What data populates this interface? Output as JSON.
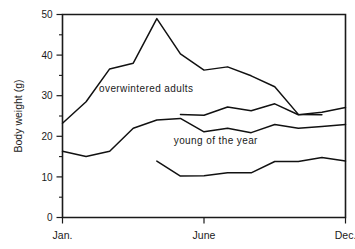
{
  "chart_data": {
    "type": "line",
    "title": "",
    "xlabel": "",
    "ylabel": "Body weight (g)",
    "ylim": [
      0,
      50
    ],
    "xlim": [
      0,
      12
    ],
    "grid": false,
    "legend": "none",
    "y_ticks_major": [
      0,
      10,
      20,
      30,
      40,
      50
    ],
    "y_ticks_minor": [
      5,
      15,
      25,
      35,
      45
    ],
    "x_ticks": [
      {
        "value": 0,
        "label": "Jan."
      },
      {
        "value": 6,
        "label": "June"
      },
      {
        "value": 12,
        "label": "Dec."
      }
    ],
    "series": [
      {
        "name": "overwintered adults",
        "x": [
          0,
          1,
          2,
          3,
          4,
          5,
          6,
          7,
          8,
          9,
          10,
          11
        ],
        "values": [
          23.2,
          28.5,
          36.6,
          38.0,
          49.0,
          40.3,
          36.3,
          37.1,
          34.9,
          32.2,
          25.4,
          25.3
        ]
      },
      {
        "name": "overwintered adults late",
        "x": [
          5,
          6,
          7,
          8,
          9,
          10,
          11,
          12
        ],
        "values": [
          25.4,
          25.2,
          27.2,
          26.3,
          28.0,
          25.3,
          25.9,
          27.1
        ]
      },
      {
        "name": "young of the year",
        "x": [
          0,
          1,
          2,
          3,
          4,
          5,
          6,
          7,
          8,
          9,
          10,
          11,
          12
        ],
        "values": [
          16.3,
          15.0,
          16.3,
          22.0,
          24.0,
          24.4,
          21.1,
          22.0,
          20.9,
          22.9,
          22.0,
          22.4,
          22.9
        ]
      },
      {
        "name": "young of the year low",
        "x": [
          4,
          5,
          6,
          7,
          8,
          9,
          10,
          11,
          12
        ],
        "values": [
          13.9,
          10.2,
          10.3,
          11.0,
          11.0,
          13.8,
          13.8,
          14.8,
          13.9
        ]
      }
    ],
    "annotations": [
      {
        "text": "overwintered adults",
        "x": 3.55,
        "y": 30.8
      },
      {
        "text": "young of the year",
        "x": 6.5,
        "y": 18.1
      }
    ]
  }
}
